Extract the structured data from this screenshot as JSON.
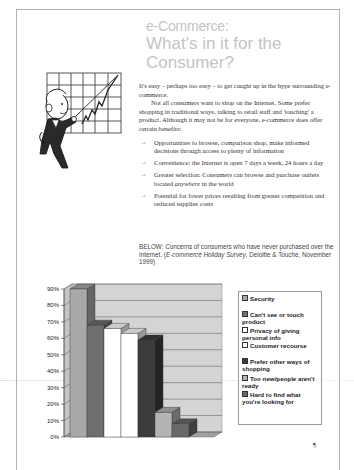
{
  "title": {
    "line1": "e-Commerce:",
    "line2": "What's in it for the",
    "line3": "Consumer?"
  },
  "intro": {
    "p1": "It's easy – perhaps too easy – to get caught up in the hype surrounding e-commerce.",
    "p2": "Not all consumers want to shop on the Internet. Some prefer shopping in traditional ways, talking to retail staff and 'touching' a product. Although it may not be for everyone, e-commerce does offer certain benefits:"
  },
  "bullets": [
    {
      "text": "Opportunities to browse, comparison shop, make informed decisions through access to plenty of information"
    },
    {
      "text": "Convenience: the Internet is open 7 days a week, 24 hours a day"
    },
    {
      "text_before": "Greater selection: Consumers can browse and purchase outlets located ",
      "text_em": "anywhere",
      "text_after": " in the world"
    },
    {
      "text": "Potential for lower prices resulting from greater competition and reduced supplies costs"
    }
  ],
  "caption": {
    "lead": "BELOW: Concerns of consumers who have never purchased over the Internet. (",
    "source_em": "E-commerce Holiday Survey",
    "tail": ", Deloitte & Touche, November 1999)"
  },
  "pilcrow": "¶",
  "clipart": {
    "icon": "businessman-pointing-chart-icon"
  },
  "chart_data": {
    "type": "bar",
    "style": "3d-column",
    "title": "",
    "xlabel": "",
    "ylabel": "",
    "ylim": [
      0,
      90
    ],
    "yticks": [
      "0%",
      "10%",
      "20%",
      "30%",
      "40%",
      "50%",
      "60%",
      "70%",
      "80%",
      "90%"
    ],
    "grid": true,
    "legend_position": "right",
    "categories": [
      "Security",
      "Can't see or touch product",
      "Privacy of giving personal info",
      "Customer recourse",
      "Prefer other ways of shopping",
      "Too new/people aren't ready",
      "Hard to find what you're looking for"
    ],
    "values": [
      90,
      68,
      66,
      63,
      59,
      15,
      8
    ],
    "colors": [
      "#a8a8a8",
      "#6e6e6e",
      "#ffffff",
      "#ffffff",
      "#3c3c3c",
      "#b4b4b4",
      "#6a6a6a"
    ],
    "unit": "%"
  }
}
